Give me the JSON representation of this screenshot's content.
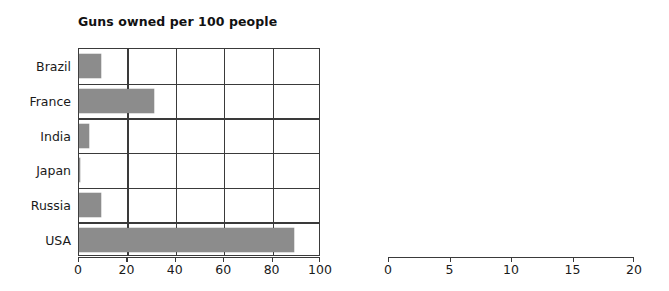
{
  "chart_data": [
    {
      "type": "bar",
      "orientation": "horizontal",
      "title": "Guns owned per 100 people",
      "xlabel": "",
      "ylabel": "",
      "categories": [
        "Brazil",
        "France",
        "India",
        "Japan",
        "Russia",
        "USA"
      ],
      "values": [
        9,
        31,
        4,
        0.6,
        9,
        89
      ],
      "xlim": [
        0,
        100
      ],
      "xticks": [
        0,
        20,
        40,
        60,
        80,
        100
      ],
      "xtick_labels": [
        "0",
        "20",
        "40",
        "60",
        "80",
        "100"
      ],
      "grid": true,
      "legend": "none",
      "bar_color": "#8c8c8c",
      "axis_color": "#3a3a3a"
    },
    {
      "type": "bar",
      "orientation": "horizontal",
      "title": "Deaths caused by firearms\n(per 100,000 people)",
      "xlabel": "",
      "ylabel": "",
      "categories": [
        "Brazil",
        "France",
        "India",
        "Japan",
        "Russia",
        "USA"
      ],
      "values": [
        19,
        3,
        0.3,
        0.1,
        14.7,
        10.4
      ],
      "xlim": [
        0,
        20
      ],
      "xticks": [
        0,
        5,
        10,
        15,
        20
      ],
      "xtick_labels": [
        "0",
        "5",
        "10",
        "15",
        "20"
      ],
      "grid": true,
      "legend": "none",
      "bar_color": "#8c8c8c",
      "axis_color": "#3a3a3a"
    }
  ]
}
